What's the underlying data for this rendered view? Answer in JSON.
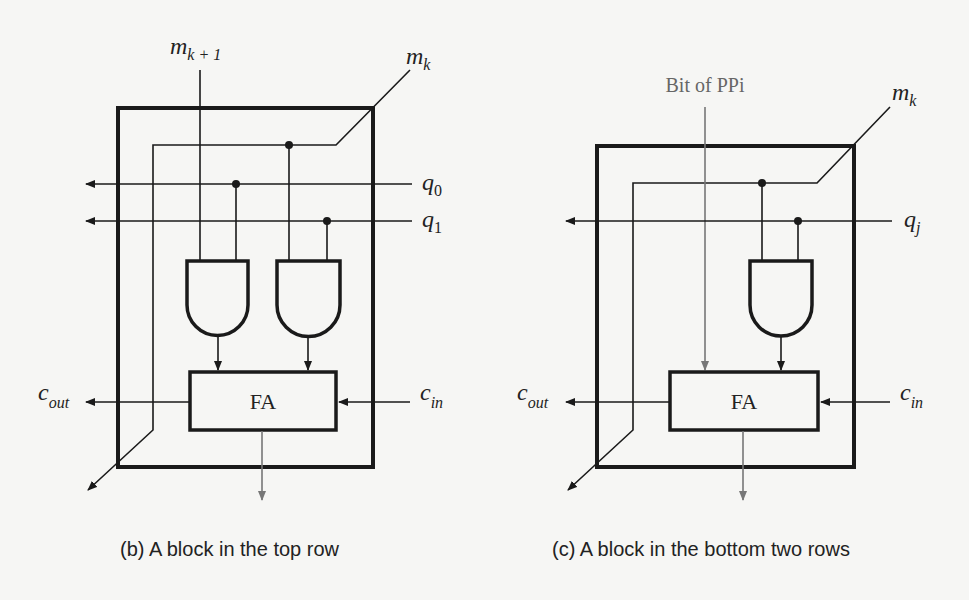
{
  "figures": [
    {
      "id": "b",
      "caption": "(b) A block in the top row",
      "inputs": {
        "top_left": {
          "base": "m",
          "sub": "k + 1"
        },
        "top_right": {
          "base": "m",
          "sub": "k"
        },
        "q0": {
          "base": "q",
          "sub": "0"
        },
        "q1": {
          "base": "q",
          "sub": "1"
        },
        "cin": {
          "base": "c",
          "sub": "in"
        }
      },
      "outputs": {
        "cout": {
          "base": "c",
          "sub": "out"
        }
      },
      "gates": [
        "AND",
        "AND"
      ],
      "adder_label": "FA"
    },
    {
      "id": "c",
      "caption": "(c) A block in the bottom two rows",
      "inputs": {
        "top_left": {
          "label": "Bit of PPi"
        },
        "top_right": {
          "base": "m",
          "sub": "k"
        },
        "qj": {
          "base": "q",
          "sub": "j"
        },
        "cin": {
          "base": "c",
          "sub": "in"
        }
      },
      "outputs": {
        "cout": {
          "base": "c",
          "sub": "out"
        }
      },
      "gates": [
        "AND"
      ],
      "adder_label": "FA"
    }
  ],
  "colors": {
    "line": "#1a1a1a",
    "gray_line": "#777777",
    "background": "#f6f6f4"
  }
}
